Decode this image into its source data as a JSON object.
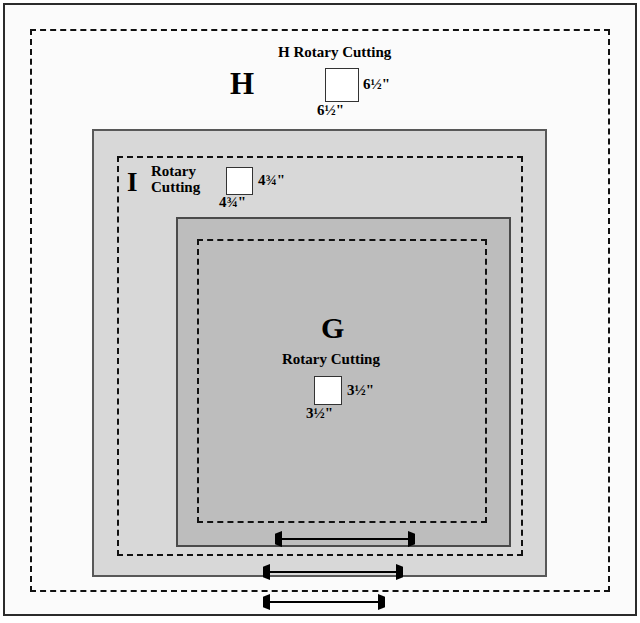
{
  "diagram": {
    "type": "quilt-block-border-diagram",
    "background_color": "#ffffff",
    "blocks": [
      {
        "id": "H",
        "letter": "H",
        "title": "H Rotary Cutting",
        "swatch_fill": "#ffffff",
        "width_label": "6½\"",
        "height_label": "6½\"",
        "fill_color": "#fbfbfb",
        "seam_line": "dashed"
      },
      {
        "id": "I",
        "letter": "I",
        "title_line1": "Rotary",
        "title_line2": "Cutting",
        "swatch_fill": "#ffffff",
        "width_label": "4¾\"",
        "height_label": "4¾\"",
        "fill_color": "#d8d8d8",
        "seam_line": "dashed"
      },
      {
        "id": "G",
        "letter": "G",
        "title": "Rotary Cutting",
        "swatch_fill": "#ffffff",
        "width_label": "3½\"",
        "height_label": "3½\"",
        "fill_color": "#bdbdbd",
        "seam_line": "dashed"
      }
    ],
    "arrows": [
      {
        "id": "arrow-g",
        "name": "g-width-arrow",
        "direction": "double-horizontal"
      },
      {
        "id": "arrow-i",
        "name": "i-width-arrow",
        "direction": "double-horizontal"
      },
      {
        "id": "arrow-h",
        "name": "h-width-arrow",
        "direction": "double-horizontal"
      }
    ],
    "colors": {
      "outer_fill": "#fbfbfb",
      "mid_fill": "#d8d8d8",
      "inner_fill": "#bdbdbd",
      "line": "#2b2b2b",
      "dash": "#111111"
    }
  }
}
